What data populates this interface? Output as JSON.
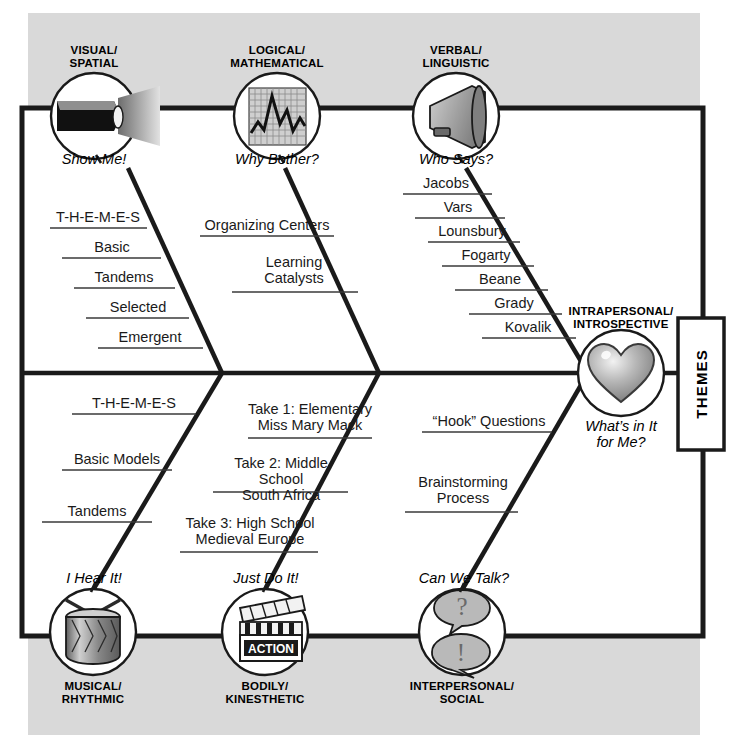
{
  "diagram": {
    "head_box_label": "THEMES",
    "colors": {
      "background_band": "#d9d9d9",
      "frame": "#1a1a1a",
      "bone": "#1a1a1a",
      "text": "#000000",
      "icon_fill": "#9a9a9a"
    }
  },
  "top_branches": [
    {
      "id": "visual-spatial",
      "name": "VISUAL/\nSPATIAL",
      "name_line1": "VISUAL/",
      "name_line2": "SPATIAL",
      "prompt": "Show Me!",
      "icon": "flashlight-icon",
      "items": [
        {
          "label": "T-H-E-M-E-S"
        },
        {
          "label": "Basic"
        },
        {
          "label": "Tandems"
        },
        {
          "label": "Selected"
        },
        {
          "label": "Emergent"
        }
      ]
    },
    {
      "id": "logical-mathematical",
      "name_line1": "LOGICAL/",
      "name_line2": "MATHEMATICAL",
      "prompt": "Why Bother?",
      "icon": "line-graph-icon",
      "items": [
        {
          "label": "Organizing Centers"
        },
        {
          "label": "Learning\nCatalysts",
          "line1": "Learning",
          "line2": "Catalysts"
        }
      ]
    },
    {
      "id": "verbal-linguistic",
      "name_line1": "VERBAL/",
      "name_line2": "LINGUISTIC",
      "prompt": "Who Says?",
      "icon": "megaphone-icon",
      "items": [
        {
          "label": "Jacobs"
        },
        {
          "label": "Vars"
        },
        {
          "label": "Lounsbury"
        },
        {
          "label": "Fogarty"
        },
        {
          "label": "Beane"
        },
        {
          "label": "Grady"
        },
        {
          "label": "Kovalik"
        }
      ]
    }
  ],
  "bottom_branches": [
    {
      "id": "musical-rhythmic",
      "name_line1": "MUSICAL/",
      "name_line2": "RHYTHMIC",
      "prompt": "I Hear It!",
      "icon": "drum-icon",
      "items": [
        {
          "label": "T-H-E-M-E-S"
        },
        {
          "label": "Basic Models"
        },
        {
          "label": "Tandems"
        }
      ]
    },
    {
      "id": "bodily-kinesthetic",
      "name_line1": "BODILY/",
      "name_line2": "KINESTHETIC",
      "prompt": "Just Do It!",
      "icon": "clapperboard-icon",
      "icon_text": "ACTION",
      "items": [
        {
          "line1": "Take 1: Elementary",
          "line2": "Miss Mary Mack"
        },
        {
          "line1": "Take 2: Middle School",
          "line2": "South Africa"
        },
        {
          "line1": "Take 3: High School",
          "line2": "Medieval Europe"
        }
      ]
    },
    {
      "id": "interpersonal-social",
      "name_line1": "INTERPERSONAL/",
      "name_line2": "SOCIAL",
      "prompt": "Can We Talk?",
      "icon": "speech-bubbles-icon",
      "items": [
        {
          "label": "“Hook” Questions"
        },
        {
          "line1": "Brainstorming",
          "line2": "Process"
        }
      ]
    }
  ],
  "head": {
    "id": "intrapersonal-introspective",
    "name_line1": "INTRAPERSONAL/",
    "name_line2": "INTROSPECTIVE",
    "prompt_line1": "What’s in It",
    "prompt_line2": "for Me?",
    "icon": "heart-icon"
  }
}
